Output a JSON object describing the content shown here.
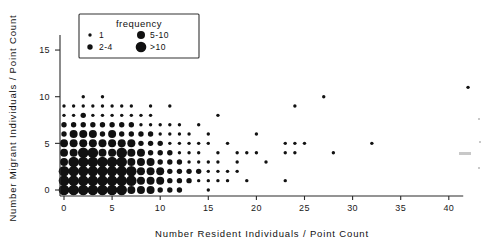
{
  "chart_data": {
    "type": "scatter",
    "title": "",
    "xlabel": "Number Resident Individuals / Point Count",
    "ylabel": "Number Migrant Individuals / Point Count",
    "xlim": [
      -1.2,
      44
    ],
    "ylim": [
      -1.1,
      16.8
    ],
    "xticks": [
      0,
      5,
      10,
      15,
      20,
      25,
      30,
      35,
      40
    ],
    "xtick_labels": [
      "0",
      "5",
      "10",
      "15",
      "20",
      "25",
      "30",
      "35",
      "40"
    ],
    "yticks": [
      0,
      5,
      10,
      15
    ],
    "ytick_labels": [
      "0",
      "5",
      "10",
      "15"
    ],
    "grid": false,
    "legend": {
      "title": "frequency",
      "position": "top-left-inside",
      "entries": [
        {
          "label": "1",
          "size_class": 1,
          "radius_px": 1.7
        },
        {
          "label": "2-4",
          "size_class": 2,
          "radius_px": 2.7
        },
        {
          "label": "5-10",
          "size_class": 3,
          "radius_px": 4.0
        },
        {
          "label": ">10",
          "size_class": 4,
          "radius_px": 5.3
        }
      ]
    },
    "encoding": {
      "size_means": "frequency (number of point counts at that x,y pair)",
      "marker": "filled circle",
      "color": "#111111"
    },
    "points": [
      [
        0,
        0,
        4
      ],
      [
        0,
        1,
        4
      ],
      [
        0,
        2,
        4
      ],
      [
        0,
        3,
        3
      ],
      [
        0,
        4,
        3
      ],
      [
        0,
        5,
        3
      ],
      [
        0,
        6,
        2
      ],
      [
        0,
        7,
        2
      ],
      [
        0,
        8,
        1
      ],
      [
        0,
        9,
        1
      ],
      [
        1,
        0,
        4
      ],
      [
        1,
        1,
        4
      ],
      [
        1,
        2,
        4
      ],
      [
        1,
        3,
        4
      ],
      [
        1,
        4,
        3
      ],
      [
        1,
        5,
        3
      ],
      [
        1,
        6,
        3
      ],
      [
        1,
        7,
        2
      ],
      [
        1,
        8,
        1
      ],
      [
        1,
        9,
        1
      ],
      [
        2,
        0,
        4
      ],
      [
        2,
        1,
        4
      ],
      [
        2,
        2,
        4
      ],
      [
        2,
        3,
        4
      ],
      [
        2,
        4,
        4
      ],
      [
        2,
        5,
        3
      ],
      [
        2,
        6,
        3
      ],
      [
        2,
        7,
        2
      ],
      [
        2,
        8,
        2
      ],
      [
        2,
        9,
        1
      ],
      [
        2,
        10,
        1
      ],
      [
        3,
        0,
        4
      ],
      [
        3,
        1,
        4
      ],
      [
        3,
        2,
        4
      ],
      [
        3,
        3,
        4
      ],
      [
        3,
        4,
        4
      ],
      [
        3,
        5,
        3
      ],
      [
        3,
        6,
        3
      ],
      [
        3,
        7,
        2
      ],
      [
        3,
        8,
        1
      ],
      [
        3,
        9,
        1
      ],
      [
        4,
        0,
        4
      ],
      [
        4,
        1,
        4
      ],
      [
        4,
        2,
        4
      ],
      [
        4,
        3,
        4
      ],
      [
        4,
        4,
        3
      ],
      [
        4,
        5,
        3
      ],
      [
        4,
        6,
        2
      ],
      [
        4,
        7,
        2
      ],
      [
        4,
        8,
        1
      ],
      [
        4,
        9,
        1
      ],
      [
        4,
        10,
        1
      ],
      [
        5,
        0,
        4
      ],
      [
        5,
        1,
        4
      ],
      [
        5,
        2,
        4
      ],
      [
        5,
        3,
        4
      ],
      [
        5,
        4,
        3
      ],
      [
        5,
        5,
        3
      ],
      [
        5,
        6,
        3
      ],
      [
        5,
        7,
        2
      ],
      [
        5,
        8,
        1
      ],
      [
        5,
        9,
        1
      ],
      [
        6,
        0,
        4
      ],
      [
        6,
        1,
        4
      ],
      [
        6,
        2,
        4
      ],
      [
        6,
        3,
        4
      ],
      [
        6,
        4,
        4
      ],
      [
        6,
        5,
        3
      ],
      [
        6,
        6,
        2
      ],
      [
        6,
        7,
        2
      ],
      [
        6,
        8,
        1
      ],
      [
        6,
        9,
        1
      ],
      [
        7,
        0,
        3
      ],
      [
        7,
        1,
        4
      ],
      [
        7,
        2,
        4
      ],
      [
        7,
        3,
        3
      ],
      [
        7,
        4,
        3
      ],
      [
        7,
        5,
        3
      ],
      [
        7,
        6,
        2
      ],
      [
        7,
        7,
        2
      ],
      [
        7,
        8,
        1
      ],
      [
        7,
        9,
        1
      ],
      [
        8,
        0,
        3
      ],
      [
        8,
        1,
        3
      ],
      [
        8,
        2,
        3
      ],
      [
        8,
        3,
        3
      ],
      [
        8,
        4,
        3
      ],
      [
        8,
        5,
        2
      ],
      [
        8,
        6,
        2
      ],
      [
        8,
        7,
        1
      ],
      [
        8,
        8,
        1
      ],
      [
        9,
        0,
        3
      ],
      [
        9,
        1,
        3
      ],
      [
        9,
        2,
        3
      ],
      [
        9,
        3,
        3
      ],
      [
        9,
        4,
        2
      ],
      [
        9,
        5,
        2
      ],
      [
        9,
        6,
        2
      ],
      [
        9,
        7,
        1
      ],
      [
        9,
        8,
        1
      ],
      [
        9,
        9,
        1
      ],
      [
        10,
        0,
        2
      ],
      [
        10,
        1,
        3
      ],
      [
        10,
        2,
        3
      ],
      [
        10,
        3,
        2
      ],
      [
        10,
        4,
        2
      ],
      [
        10,
        5,
        2
      ],
      [
        10,
        6,
        1
      ],
      [
        10,
        7,
        1
      ],
      [
        11,
        0,
        2
      ],
      [
        11,
        1,
        2
      ],
      [
        11,
        2,
        2
      ],
      [
        11,
        3,
        2
      ],
      [
        11,
        4,
        2
      ],
      [
        11,
        5,
        1
      ],
      [
        11,
        6,
        1
      ],
      [
        11,
        7,
        1
      ],
      [
        11,
        9,
        1
      ],
      [
        12,
        0,
        2
      ],
      [
        12,
        1,
        2
      ],
      [
        12,
        2,
        2
      ],
      [
        12,
        3,
        2
      ],
      [
        12,
        4,
        1
      ],
      [
        12,
        5,
        1
      ],
      [
        12,
        6,
        1
      ],
      [
        12,
        7,
        1
      ],
      [
        13,
        1,
        2
      ],
      [
        13,
        2,
        2
      ],
      [
        13,
        3,
        1
      ],
      [
        13,
        4,
        1
      ],
      [
        13,
        5,
        1
      ],
      [
        13,
        6,
        1
      ],
      [
        14,
        1,
        1
      ],
      [
        14,
        2,
        2
      ],
      [
        14,
        3,
        1
      ],
      [
        14,
        4,
        1
      ],
      [
        14,
        5,
        1
      ],
      [
        14,
        7,
        1
      ],
      [
        15,
        0,
        1
      ],
      [
        15,
        1,
        1
      ],
      [
        15,
        2,
        1
      ],
      [
        15,
        3,
        1
      ],
      [
        15,
        5,
        1
      ],
      [
        15,
        6,
        1
      ],
      [
        16,
        1,
        1
      ],
      [
        16,
        2,
        1
      ],
      [
        16,
        3,
        1
      ],
      [
        16,
        4,
        1
      ],
      [
        16,
        8,
        1
      ],
      [
        17,
        1,
        1
      ],
      [
        17,
        2,
        1
      ],
      [
        17,
        5,
        1
      ],
      [
        18,
        2,
        1
      ],
      [
        18,
        3,
        1
      ],
      [
        18,
        4,
        1
      ],
      [
        19,
        1,
        1
      ],
      [
        19,
        4,
        1
      ],
      [
        20,
        4,
        1
      ],
      [
        20,
        6,
        1
      ],
      [
        21,
        3,
        1
      ],
      [
        23,
        1,
        1
      ],
      [
        23,
        4,
        1
      ],
      [
        23,
        5,
        1
      ],
      [
        24,
        4,
        1
      ],
      [
        24,
        5,
        1
      ],
      [
        24,
        9,
        1
      ],
      [
        25,
        5,
        1
      ],
      [
        27,
        10,
        1
      ],
      [
        28,
        4,
        1
      ],
      [
        32,
        5,
        1
      ],
      [
        42,
        11,
        1
      ]
    ]
  },
  "figure": {
    "caption": ""
  }
}
